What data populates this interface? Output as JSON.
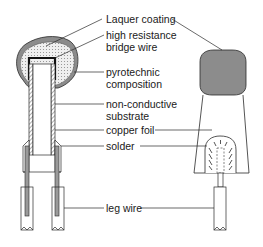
{
  "diagram": {
    "type": "cross-section of electric detonator match-head",
    "labels": {
      "laquer_coating": "Laquer coating",
      "bridge_wire_1": "high resistance",
      "bridge_wire_2": "bridge wire",
      "pyrotechnic_1": "pyrotechnic",
      "pyrotechnic_2": "composition",
      "substrate_1": "non-conductive",
      "substrate_2": "substrate",
      "copper_foil": "copper foil",
      "solder": "solder",
      "leg_wire": "leg wire"
    },
    "colors": {
      "line": "#2a2a2a",
      "coating_gray": "#8c8c8c",
      "composition_fill": "#e6e6e6",
      "solder_gray": "#9a9a9a"
    }
  }
}
